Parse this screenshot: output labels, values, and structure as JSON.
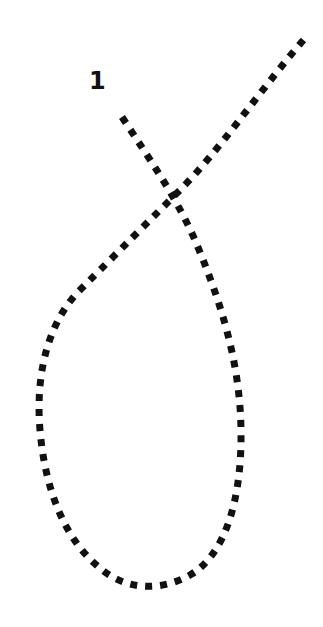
{
  "diagram": {
    "labels": [
      {
        "text": "1",
        "x": 89,
        "y": 69
      }
    ],
    "path": {
      "style": "dotted",
      "color": "#111111",
      "dot_size": 7,
      "dot_gap": 8,
      "start_point": [
        122,
        117
      ],
      "end_point": [
        306,
        37
      ],
      "d": "M122,117 C150,160 175,195 195,240 C220,300 240,360 241,430 C242,500 225,555 190,575 C160,592 125,590 100,568 C65,540 45,490 40,430 C35,370 50,320 80,290 C120,250 150,220 180,190 C220,150 260,90 306,37"
    }
  }
}
